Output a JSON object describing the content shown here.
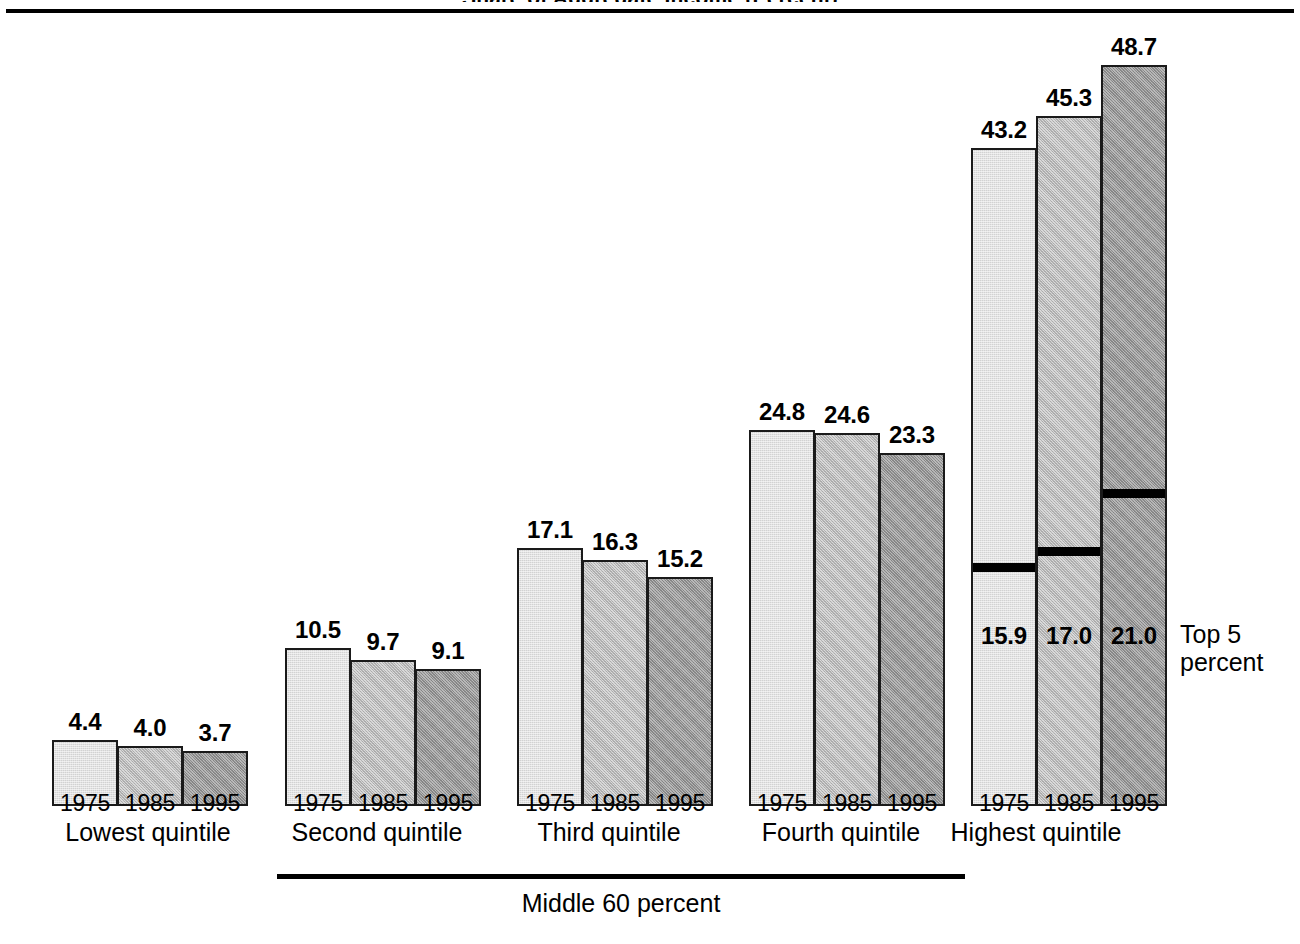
{
  "figure": {
    "title_clipped": "Share of Aggregate Income (Percent)",
    "top_rule": true
  },
  "annotations": {
    "top5_label_line1": "Top 5",
    "top5_label_line2": "percent",
    "middle60_label": "Middle 60 percent"
  },
  "colors": {
    "year_1975": "#d2d2d2",
    "year_1985": "#bdbdbd",
    "year_1995": "#9e9e9e",
    "outline": "#1a1a1a",
    "background": "#ffffff",
    "divider": "#000000"
  },
  "chart_data": {
    "type": "bar",
    "title": "Share of Aggregate Income (Percent)",
    "xlabel": "",
    "ylabel": "",
    "ylim": [
      0,
      48.7
    ],
    "grid": false,
    "legend": "none",
    "categories": [
      "Lowest quintile",
      "Second quintile",
      "Third quintile",
      "Fourth quintile",
      "Highest quintile"
    ],
    "x": [
      "1975",
      "1985",
      "1995"
    ],
    "series": [
      {
        "name": "1975",
        "values": [
          4.4,
          10.5,
          17.1,
          24.8,
          43.2
        ]
      },
      {
        "name": "1985",
        "values": [
          4.0,
          9.7,
          16.3,
          24.6,
          45.3
        ]
      },
      {
        "name": "1995",
        "values": [
          3.7,
          9.1,
          15.2,
          23.3,
          48.7
        ]
      }
    ],
    "sub_segment": {
      "name": "Top 5 percent",
      "applies_to": "Highest quintile",
      "values": [
        15.9,
        17.0,
        21.0
      ],
      "x": [
        "1975",
        "1985",
        "1995"
      ]
    },
    "bracket": {
      "label": "Middle 60 percent",
      "spans": [
        "Second quintile",
        "Third quintile",
        "Fourth quintile"
      ]
    }
  },
  "groups": [
    {
      "caption": "Lowest quintile",
      "caption_x": 148,
      "caption_y": 818,
      "bars": [
        {
          "year": "1975",
          "value": "4.4",
          "x": 52,
          "w": 66,
          "top": 740,
          "shade": "sh-1975",
          "label_x": 52,
          "label_y": 708
        },
        {
          "year": "1985",
          "value": "4.0",
          "x": 117,
          "w": 66,
          "top": 746,
          "shade": "sh-1985",
          "label_x": 117,
          "label_y": 714
        },
        {
          "year": "1995",
          "value": "3.7",
          "x": 182,
          "w": 66,
          "top": 751,
          "shade": "sh-1995",
          "label_x": 182,
          "label_y": 719
        }
      ],
      "years": [
        {
          "text": "1975",
          "x": 52,
          "y": 790
        },
        {
          "text": "1985",
          "x": 117,
          "y": 790
        },
        {
          "text": "1995",
          "x": 182,
          "y": 790
        }
      ]
    },
    {
      "caption": "Second quintile",
      "caption_x": 377,
      "caption_y": 818,
      "bars": [
        {
          "year": "1975",
          "value": "10.5",
          "x": 285,
          "w": 66,
          "top": 648,
          "shade": "sh-1975",
          "label_x": 285,
          "label_y": 616
        },
        {
          "year": "1985",
          "value": "9.7",
          "x": 350,
          "w": 66,
          "top": 660,
          "shade": "sh-1985",
          "label_x": 350,
          "label_y": 628
        },
        {
          "year": "1995",
          "value": "9.1",
          "x": 415,
          "w": 66,
          "top": 669,
          "shade": "sh-1995",
          "label_x": 415,
          "label_y": 637
        }
      ],
      "years": [
        {
          "text": "1975",
          "x": 285,
          "y": 790
        },
        {
          "text": "1985",
          "x": 350,
          "y": 790
        },
        {
          "text": "1995",
          "x": 415,
          "y": 790
        }
      ]
    },
    {
      "caption": "Third quintile",
      "caption_x": 609,
      "caption_y": 818,
      "bars": [
        {
          "year": "1975",
          "value": "17.1",
          "x": 517,
          "w": 66,
          "top": 548,
          "shade": "sh-1975",
          "label_x": 517,
          "label_y": 516
        },
        {
          "year": "1985",
          "value": "16.3",
          "x": 582,
          "w": 66,
          "top": 560,
          "shade": "sh-1985",
          "label_x": 582,
          "label_y": 528
        },
        {
          "year": "1995",
          "value": "15.2",
          "x": 647,
          "w": 66,
          "top": 577,
          "shade": "sh-1995",
          "label_x": 647,
          "label_y": 545
        }
      ],
      "years": [
        {
          "text": "1975",
          "x": 517,
          "y": 790
        },
        {
          "text": "1985",
          "x": 582,
          "y": 790
        },
        {
          "text": "1995",
          "x": 647,
          "y": 790
        }
      ]
    },
    {
      "caption": "Fourth quintile",
      "caption_x": 841,
      "caption_y": 818,
      "bars": [
        {
          "year": "1975",
          "value": "24.8",
          "x": 749,
          "w": 66,
          "top": 430,
          "shade": "sh-1975",
          "label_x": 749,
          "label_y": 398
        },
        {
          "year": "1985",
          "value": "24.6",
          "x": 814,
          "w": 66,
          "top": 433,
          "shade": "sh-1985",
          "label_x": 814,
          "label_y": 401
        },
        {
          "year": "1995",
          "value": "23.3",
          "x": 879,
          "w": 66,
          "top": 453,
          "shade": "sh-1995",
          "label_x": 879,
          "label_y": 421
        }
      ],
      "years": [
        {
          "text": "1975",
          "x": 749,
          "y": 790
        },
        {
          "text": "1985",
          "x": 814,
          "y": 790
        },
        {
          "text": "1995",
          "x": 879,
          "y": 790
        }
      ]
    },
    {
      "caption": "Highest quintile",
      "caption_x": 1036,
      "caption_y": 818,
      "bars": [
        {
          "year": "1975",
          "value": "43.2",
          "x": 971,
          "w": 66,
          "top": 148,
          "shade": "sh-1975",
          "label_x": 971,
          "label_y": 116,
          "top5": "15.9",
          "top5_rule_y": 563,
          "top5_label_y": 622
        },
        {
          "year": "1985",
          "value": "45.3",
          "x": 1036,
          "w": 66,
          "top": 116,
          "shade": "sh-1985",
          "label_x": 1036,
          "label_y": 84,
          "top5": "17.0",
          "top5_rule_y": 547,
          "top5_label_y": 622
        },
        {
          "year": "1995",
          "value": "48.7",
          "x": 1101,
          "w": 66,
          "top": 65,
          "shade": "sh-1995",
          "label_x": 1101,
          "label_y": 33,
          "top5": "21.0",
          "top5_rule_y": 489,
          "top5_label_y": 622
        }
      ],
      "years": [
        {
          "text": "1975",
          "x": 971,
          "y": 790
        },
        {
          "text": "1985",
          "x": 1036,
          "y": 790
        },
        {
          "text": "1995",
          "x": 1101,
          "y": 790
        }
      ]
    }
  ],
  "layout": {
    "baseline_y": 806,
    "bar_width": 66,
    "top5_annot_x": 1180,
    "top5_annot_y": 620,
    "mid_rule_x": 277,
    "mid_rule_y": 874,
    "mid_rule_w": 688,
    "mid_caption_x": 621,
    "mid_caption_y": 889
  }
}
